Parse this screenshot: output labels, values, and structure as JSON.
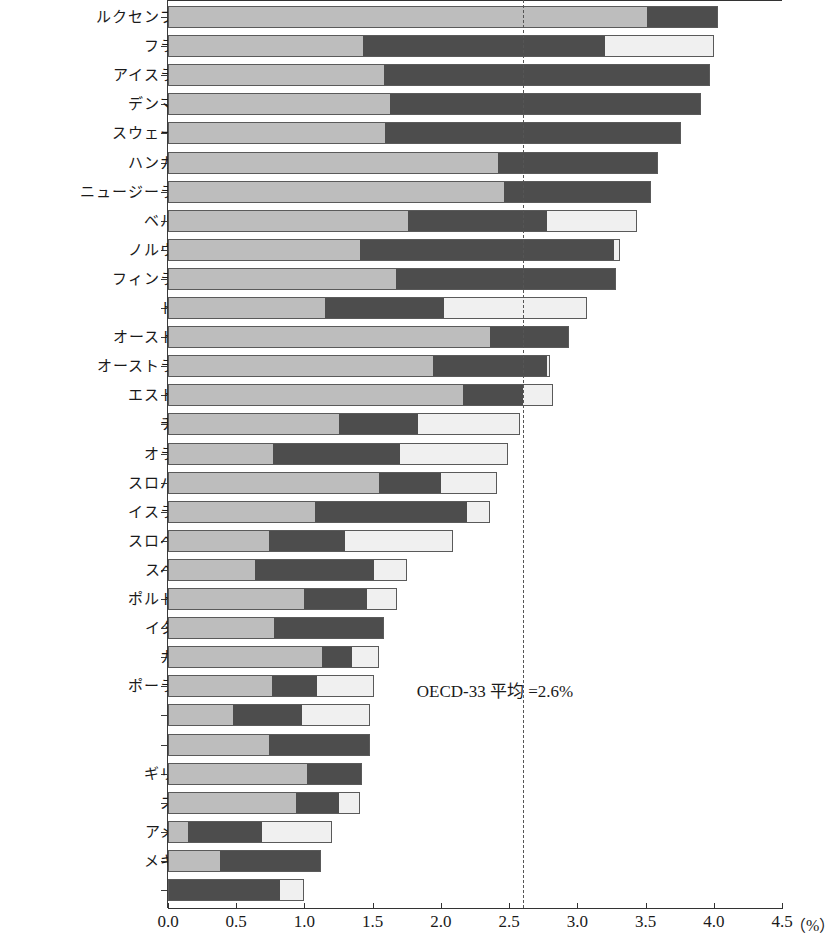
{
  "chart_data": {
    "type": "bar",
    "orientation": "horizontal",
    "stacked": true,
    "title": "",
    "xlabel": "(%)",
    "ylabel": "",
    "xlim": [
      0.0,
      4.5
    ],
    "xticks": [
      0.0,
      0.5,
      1.0,
      1.5,
      2.0,
      2.5,
      3.0,
      3.5,
      4.0,
      4.5
    ],
    "xticklabels": [
      "0.0",
      "0.5",
      "1.0",
      "1.5",
      "2.0",
      "2.5",
      "3.0",
      "3.5",
      "4.0",
      "4.5"
    ],
    "unit_label": "(%)",
    "grid": false,
    "legend_position": "none",
    "annotations": [
      {
        "text": "OECD-33 平均 =2.6%",
        "x": 2.6,
        "note": "dashed reference line at OECD-33 average"
      }
    ],
    "reference_line": {
      "value": 2.6,
      "style": "dashed",
      "label": "OECD-33 平均 =2.6%"
    },
    "colors": {
      "segment_a": "#bdbdbd",
      "segment_b": "#4d4d4d",
      "segment_c": "#f0f0f0"
    },
    "categories": [
      "ルクセンブルク",
      "フランス",
      "アイスランド",
      "デンマーク",
      "スウェーデン",
      "ハンガリー",
      "ニュージーランド",
      "ベルギー",
      "ノルウェー",
      "フィンランド",
      "ドイツ",
      "オーストリア",
      "オーストラリア",
      "エストニア",
      "チェコ",
      "オランダ",
      "スロバキア",
      "イスラエル",
      "スロベニア",
      "スペイン",
      "ポルトガル",
      "イタリア",
      "カナダ",
      "ポーランド",
      "日本",
      "チリ",
      "ギリシャ",
      "スイス",
      "アメリカ",
      "メキシコ",
      "韓国"
    ],
    "series": [
      {
        "name": "segment_a",
        "values": [
          3.51,
          1.43,
          1.58,
          1.63,
          1.59,
          2.42,
          2.46,
          1.76,
          1.41,
          1.67,
          1.15,
          2.36,
          1.94,
          2.16,
          1.25,
          0.77,
          1.55,
          1.08,
          0.74,
          0.64,
          1.0,
          0.78,
          1.13,
          0.76,
          0.48,
          0.74,
          1.02,
          0.94,
          0.15,
          0.38,
          0.0
        ]
      },
      {
        "name": "segment_b",
        "values": [
          0.52,
          1.77,
          2.39,
          2.28,
          2.17,
          1.17,
          1.08,
          1.02,
          1.86,
          1.61,
          0.87,
          0.58,
          0.84,
          0.44,
          0.58,
          0.93,
          0.45,
          1.11,
          0.56,
          0.87,
          0.46,
          0.8,
          0.22,
          0.33,
          0.5,
          0.74,
          0.4,
          0.31,
          0.54,
          0.74,
          0.82
        ]
      },
      {
        "name": "segment_c",
        "values": [
          0.0,
          0.8,
          0.0,
          0.0,
          0.0,
          0.0,
          0.0,
          0.66,
          0.04,
          0.0,
          1.05,
          0.0,
          0.02,
          0.22,
          0.75,
          0.79,
          0.41,
          0.17,
          0.79,
          0.24,
          0.22,
          0.0,
          0.2,
          0.42,
          0.5,
          0.0,
          0.0,
          0.16,
          0.51,
          0.0,
          0.18
        ]
      }
    ],
    "totals": [
      4.03,
      4.0,
      3.97,
      3.91,
      3.76,
      3.59,
      3.54,
      3.44,
      3.31,
      3.28,
      3.07,
      2.94,
      2.8,
      2.82,
      2.58,
      2.49,
      2.41,
      2.36,
      2.09,
      1.75,
      1.68,
      1.58,
      1.55,
      1.51,
      1.48,
      1.48,
      1.42,
      1.41,
      1.2,
      1.12,
      1.0
    ]
  },
  "axis": {
    "unit": "（%）"
  }
}
